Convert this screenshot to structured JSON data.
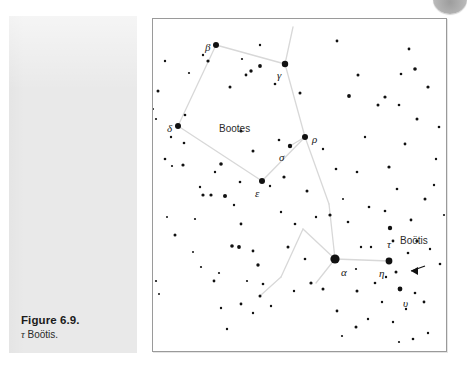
{
  "figure": {
    "caption_title": "Figure 6.9.",
    "caption_subject_symbol": "τ",
    "caption_subject_name": " Boötis."
  },
  "chart_data": {
    "type": "scatter",
    "xlabel": "",
    "ylabel": "",
    "xlim": [
      0,
      293
    ],
    "ylim": [
      0,
      332
    ],
    "grid": false,
    "legend": "none",
    "background": "#ffffff",
    "border_color": "#9a9a9a",
    "star_color": "#111111",
    "line_color": "#d8d8d8",
    "annotations": [
      {
        "name": "constellation-name",
        "text": "Bootes",
        "x": 66,
        "y": 104,
        "style": "name"
      },
      {
        "name": "star-label-beta",
        "text": "β",
        "x": 52,
        "y": 22,
        "style": "greek"
      },
      {
        "name": "star-label-gamma",
        "text": "γ",
        "x": 124,
        "y": 50,
        "style": "greek"
      },
      {
        "name": "star-label-delta",
        "text": "δ",
        "x": 14,
        "y": 103,
        "style": "greek"
      },
      {
        "name": "star-label-rho",
        "text": "ρ",
        "x": 159,
        "y": 114,
        "style": "greek"
      },
      {
        "name": "star-label-sigma",
        "text": "σ",
        "x": 126,
        "y": 132,
        "style": "greek"
      },
      {
        "name": "star-label-epsilon",
        "text": "ε",
        "x": 102,
        "y": 168,
        "style": "greek"
      },
      {
        "name": "star-label-alpha",
        "text": "α",
        "x": 188,
        "y": 247,
        "style": "greek"
      },
      {
        "name": "star-label-tau",
        "text": "τ",
        "x": 234,
        "y": 219,
        "style": "greek"
      },
      {
        "name": "star-label-eta",
        "text": "η",
        "x": 226,
        "y": 248,
        "style": "greek"
      },
      {
        "name": "star-label-upsilon",
        "text": "υ",
        "x": 250,
        "y": 278,
        "style": "greek"
      },
      {
        "name": "target-name-bootis",
        "text": "Boötis",
        "x": 247,
        "y": 216,
        "style": "name"
      }
    ],
    "named_stars": [
      {
        "label": "β",
        "x": 63,
        "y": 26,
        "r": 3.0
      },
      {
        "label": "γ",
        "x": 132,
        "y": 45,
        "r": 3.2
      },
      {
        "label": "δ",
        "x": 25,
        "y": 107,
        "r": 3.0
      },
      {
        "label": "ρ",
        "x": 152,
        "y": 118,
        "r": 3.0
      },
      {
        "label": "σ",
        "x": 137,
        "y": 127,
        "r": 2.2
      },
      {
        "label": "ε",
        "x": 109,
        "y": 162,
        "r": 3.0
      },
      {
        "label": "α",
        "x": 182,
        "y": 240,
        "r": 4.6
      },
      {
        "label": "τ",
        "x": 237,
        "y": 209,
        "r": 2.2
      },
      {
        "label": "η",
        "x": 236,
        "y": 242,
        "r": 3.4
      },
      {
        "label": "υ",
        "x": 247,
        "y": 270,
        "r": 2.4
      }
    ],
    "constellation_lines": [
      [
        [
          63,
          26
        ],
        [
          132,
          45
        ]
      ],
      [
        [
          63,
          26
        ],
        [
          25,
          107
        ]
      ],
      [
        [
          25,
          107
        ],
        [
          109,
          162
        ]
      ],
      [
        [
          109,
          162
        ],
        [
          152,
          118
        ]
      ],
      [
        [
          152,
          118
        ],
        [
          137,
          127
        ]
      ],
      [
        [
          132,
          45
        ],
        [
          152,
          118
        ]
      ],
      [
        [
          152,
          118
        ],
        [
          176,
          185
        ]
      ],
      [
        [
          176,
          185
        ],
        [
          182,
          240
        ]
      ],
      [
        [
          182,
          240
        ],
        [
          236,
          242
        ]
      ],
      [
        [
          182,
          240
        ],
        [
          150,
          210
        ]
      ],
      [
        [
          150,
          210
        ],
        [
          128,
          258
        ]
      ],
      [
        [
          128,
          258
        ],
        [
          108,
          276
        ]
      ],
      [
        [
          132,
          45
        ],
        [
          140,
          8
        ]
      ],
      [
        [
          182,
          240
        ],
        [
          163,
          264
        ]
      ]
    ],
    "field_stars": [
      {
        "x": 12,
        "y": 42,
        "r": 1.2
      },
      {
        "x": 36,
        "y": 54,
        "r": 1.1
      },
      {
        "x": 5,
        "y": 72,
        "r": 1.5
      },
      {
        "x": 3,
        "y": 100,
        "r": 1.1
      },
      {
        "x": 0,
        "y": 90,
        "r": 1.0
      },
      {
        "x": 18,
        "y": 118,
        "r": 1.2
      },
      {
        "x": 31,
        "y": 124,
        "r": 1.3
      },
      {
        "x": 12,
        "y": 140,
        "r": 1.3
      },
      {
        "x": 19,
        "y": 147,
        "r": 1.1
      },
      {
        "x": 30,
        "y": 146,
        "r": 1.6
      },
      {
        "x": 55,
        "y": 42,
        "r": 1.6
      },
      {
        "x": 50,
        "y": 36,
        "r": 1.2
      },
      {
        "x": 77,
        "y": 68,
        "r": 1.5
      },
      {
        "x": 88,
        "y": 112,
        "r": 1.6
      },
      {
        "x": 98,
        "y": 52,
        "r": 1.7
      },
      {
        "x": 93,
        "y": 56,
        "r": 1.4
      },
      {
        "x": 107,
        "y": 47,
        "r": 1.9
      },
      {
        "x": 89,
        "y": 40,
        "r": 1.1
      },
      {
        "x": 107,
        "y": 26,
        "r": 1.2
      },
      {
        "x": 122,
        "y": 65,
        "r": 1.3
      },
      {
        "x": 126,
        "y": 121,
        "r": 1.3
      },
      {
        "x": 100,
        "y": 132,
        "r": 1.5
      },
      {
        "x": 87,
        "y": 163,
        "r": 1.3
      },
      {
        "x": 117,
        "y": 167,
        "r": 1.2
      },
      {
        "x": 131,
        "y": 158,
        "r": 1.6
      },
      {
        "x": 147,
        "y": 74,
        "r": 1.5
      },
      {
        "x": 154,
        "y": 172,
        "r": 1.5
      },
      {
        "x": 183,
        "y": 150,
        "r": 1.3
      },
      {
        "x": 196,
        "y": 77,
        "r": 1.9
      },
      {
        "x": 204,
        "y": 153,
        "r": 1.3
      },
      {
        "x": 68,
        "y": 145,
        "r": 1.8
      },
      {
        "x": 62,
        "y": 153,
        "r": 1.2
      },
      {
        "x": 58,
        "y": 176,
        "r": 1.6
      },
      {
        "x": 50,
        "y": 176,
        "r": 1.6
      },
      {
        "x": 72,
        "y": 177,
        "r": 2.0
      },
      {
        "x": 47,
        "y": 168,
        "r": 1.2
      },
      {
        "x": 81,
        "y": 186,
        "r": 1.2
      },
      {
        "x": 88,
        "y": 205,
        "r": 1.4
      },
      {
        "x": 14,
        "y": 198,
        "r": 1.0
      },
      {
        "x": 22,
        "y": 216,
        "r": 1.5
      },
      {
        "x": 40,
        "y": 233,
        "r": 1.0
      },
      {
        "x": 79,
        "y": 227,
        "r": 1.8
      },
      {
        "x": 86,
        "y": 228,
        "r": 1.9
      },
      {
        "x": 48,
        "y": 248,
        "r": 1.1
      },
      {
        "x": 100,
        "y": 232,
        "r": 1.4
      },
      {
        "x": 105,
        "y": 246,
        "r": 1.7
      },
      {
        "x": 110,
        "y": 265,
        "r": 1.3
      },
      {
        "x": 94,
        "y": 262,
        "r": 1.1
      },
      {
        "x": 61,
        "y": 262,
        "r": 1.4
      },
      {
        "x": 66,
        "y": 254,
        "r": 1.1
      },
      {
        "x": 3,
        "y": 262,
        "r": 1.1
      },
      {
        "x": 6,
        "y": 275,
        "r": 1.0
      },
      {
        "x": 68,
        "y": 289,
        "r": 1.2
      },
      {
        "x": 88,
        "y": 285,
        "r": 1.4
      },
      {
        "x": 100,
        "y": 294,
        "r": 1.2
      },
      {
        "x": 107,
        "y": 277,
        "r": 1.5
      },
      {
        "x": 118,
        "y": 287,
        "r": 1.2
      },
      {
        "x": 74,
        "y": 310,
        "r": 1.2
      },
      {
        "x": 135,
        "y": 228,
        "r": 1.5
      },
      {
        "x": 142,
        "y": 205,
        "r": 1.3
      },
      {
        "x": 152,
        "y": 240,
        "r": 1.3
      },
      {
        "x": 158,
        "y": 264,
        "r": 1.6
      },
      {
        "x": 141,
        "y": 272,
        "r": 1.2
      },
      {
        "x": 170,
        "y": 270,
        "r": 1.5
      },
      {
        "x": 177,
        "y": 196,
        "r": 1.6
      },
      {
        "x": 163,
        "y": 198,
        "r": 1.2
      },
      {
        "x": 190,
        "y": 180,
        "r": 1.0
      },
      {
        "x": 195,
        "y": 203,
        "r": 1.3
      },
      {
        "x": 208,
        "y": 228,
        "r": 1.2
      },
      {
        "x": 203,
        "y": 250,
        "r": 1.1
      },
      {
        "x": 204,
        "y": 272,
        "r": 1.5
      },
      {
        "x": 184,
        "y": 292,
        "r": 1.4
      },
      {
        "x": 203,
        "y": 308,
        "r": 1.5
      },
      {
        "x": 215,
        "y": 300,
        "r": 1.2
      },
      {
        "x": 189,
        "y": 317,
        "r": 1.1
      },
      {
        "x": 229,
        "y": 283,
        "r": 1.2
      },
      {
        "x": 222,
        "y": 264,
        "r": 1.3
      },
      {
        "x": 216,
        "y": 188,
        "r": 1.3
      },
      {
        "x": 232,
        "y": 192,
        "r": 1.3
      },
      {
        "x": 240,
        "y": 222,
        "r": 1.4
      },
      {
        "x": 243,
        "y": 253,
        "r": 1.5
      },
      {
        "x": 233,
        "y": 258,
        "r": 1.2
      },
      {
        "x": 255,
        "y": 234,
        "r": 1.3
      },
      {
        "x": 264,
        "y": 222,
        "r": 1.6
      },
      {
        "x": 253,
        "y": 290,
        "r": 1.2
      },
      {
        "x": 262,
        "y": 274,
        "r": 1.3
      },
      {
        "x": 271,
        "y": 283,
        "r": 1.4
      },
      {
        "x": 240,
        "y": 303,
        "r": 1.2
      },
      {
        "x": 260,
        "y": 320,
        "r": 1.3
      },
      {
        "x": 275,
        "y": 314,
        "r": 1.2
      },
      {
        "x": 246,
        "y": 323,
        "r": 1.1
      },
      {
        "x": 272,
        "y": 180,
        "r": 1.5
      },
      {
        "x": 258,
        "y": 201,
        "r": 1.4
      },
      {
        "x": 244,
        "y": 170,
        "r": 1.3
      },
      {
        "x": 236,
        "y": 148,
        "r": 1.6
      },
      {
        "x": 252,
        "y": 125,
        "r": 1.4
      },
      {
        "x": 264,
        "y": 100,
        "r": 1.5
      },
      {
        "x": 246,
        "y": 86,
        "r": 1.3
      },
      {
        "x": 232,
        "y": 78,
        "r": 1.6
      },
      {
        "x": 225,
        "y": 86,
        "r": 1.5
      },
      {
        "x": 248,
        "y": 55,
        "r": 1.3
      },
      {
        "x": 262,
        "y": 50,
        "r": 1.8
      },
      {
        "x": 275,
        "y": 68,
        "r": 1.6
      },
      {
        "x": 256,
        "y": 30,
        "r": 1.4
      },
      {
        "x": 184,
        "y": 22,
        "r": 1.4
      },
      {
        "x": 205,
        "y": 56,
        "r": 1.5
      },
      {
        "x": 170,
        "y": 130,
        "r": 1.2
      },
      {
        "x": 212,
        "y": 118,
        "r": 1.2
      },
      {
        "x": 286,
        "y": 108,
        "r": 1.3
      },
      {
        "x": 283,
        "y": 140,
        "r": 1.2
      },
      {
        "x": 281,
        "y": 166,
        "r": 1.2
      },
      {
        "x": 287,
        "y": 245,
        "r": 1.3
      },
      {
        "x": 277,
        "y": 230,
        "r": 1.2
      },
      {
        "x": 291,
        "y": 196,
        "r": 1.1
      },
      {
        "x": 218,
        "y": 228,
        "r": 1.2
      },
      {
        "x": 128,
        "y": 193,
        "r": 1.2
      },
      {
        "x": 42,
        "y": 200,
        "r": 1.1
      },
      {
        "x": 32,
        "y": 96,
        "r": 1.3
      }
    ],
    "arrow_marker": {
      "name": "tau-bootis-pointer",
      "tip_x": 258,
      "tip_y": 252,
      "tail_x": 272,
      "tail_y": 247,
      "direction": "left"
    }
  }
}
